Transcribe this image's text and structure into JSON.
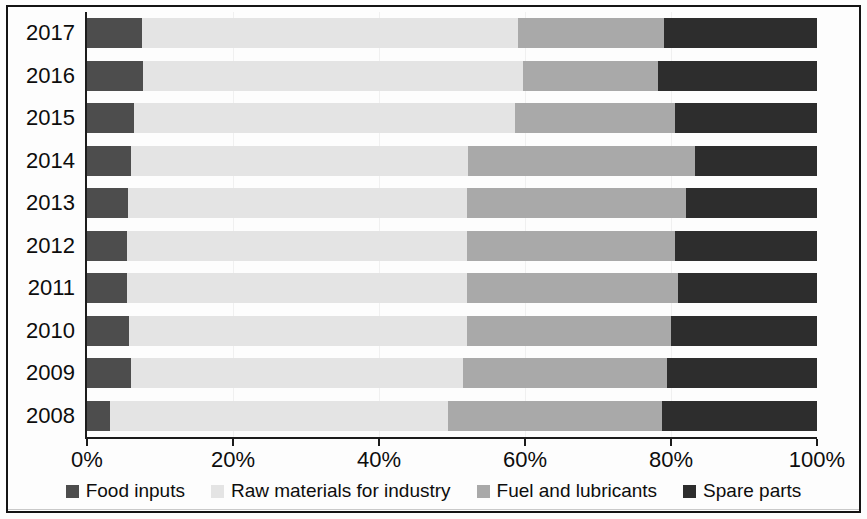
{
  "chart_data": {
    "type": "bar",
    "orientation": "horizontal",
    "stacked": true,
    "stack_mode": "percent",
    "title": "",
    "subtitle": "",
    "xlabel": "",
    "ylabel": "",
    "xlim": [
      0,
      100
    ],
    "xticks": [
      0,
      20,
      40,
      60,
      80,
      100
    ],
    "xtick_labels": [
      "0%",
      "20%",
      "40%",
      "60%",
      "80%",
      "100%"
    ],
    "grid": false,
    "legend_position": "bottom",
    "categories": [
      "2017",
      "2016",
      "2015",
      "2014",
      "2013",
      "2012",
      "2011",
      "2010",
      "2009",
      "2008"
    ],
    "series": [
      {
        "name": "Food inputs",
        "color": "#4d4d4d",
        "values": [
          7.5,
          7.7,
          6.4,
          6.0,
          5.6,
          5.5,
          5.5,
          5.8,
          6.0,
          3.2
        ]
      },
      {
        "name": "Raw materials for industry",
        "color": "#e4e4e4",
        "values": [
          51.5,
          52.0,
          52.2,
          46.2,
          46.4,
          46.5,
          46.5,
          46.2,
          45.5,
          46.3
        ]
      },
      {
        "name": "Fuel and lubricants",
        "color": "#a9a9a9",
        "values": [
          20.0,
          18.5,
          22.0,
          31.1,
          30.0,
          28.5,
          29.0,
          28.0,
          28.0,
          29.3
        ]
      },
      {
        "name": "Spare parts",
        "color": "#2d2d2d",
        "values": [
          21.0,
          21.8,
          19.4,
          16.7,
          18.0,
          19.5,
          19.0,
          20.0,
          20.5,
          21.2
        ]
      }
    ]
  }
}
